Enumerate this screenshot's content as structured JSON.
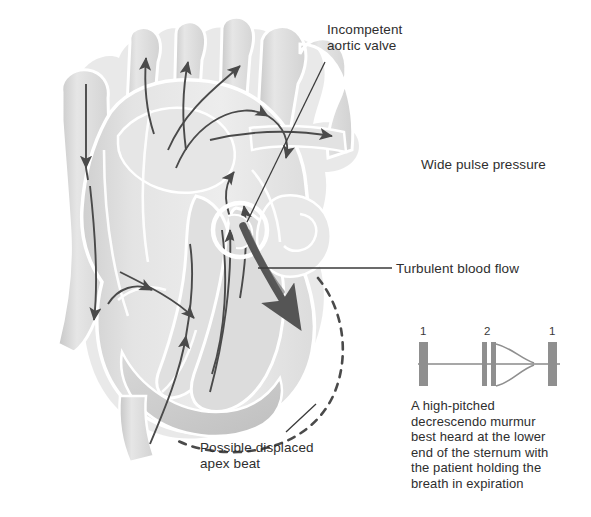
{
  "figure": {
    "background_color": "#ffffff",
    "ink_color": "#3a3a3a",
    "heart_fill_light": "#ececec",
    "heart_fill_mid": "#d9d9d9",
    "heart_fill_dark": "#c2c2c2",
    "highlight_color": "#ffffff"
  },
  "labels": {
    "aortic_valve": "Incompetent\naortic valve",
    "pulse_pressure": "Wide pulse pressure",
    "turbulent_flow": "Turbulent blood flow",
    "apex_beat": "Possible displaced\napex beat",
    "murmur": "A high-pitched\ndecrescendo murmur\nbest heard at the lower\nend of the sternum with\nthe patient holding the\nbreath in expiration"
  },
  "phonocardiogram": {
    "type": "heart-sound-trace",
    "sounds": [
      {
        "label": "1",
        "name": "first-heart-sound",
        "split": false
      },
      {
        "label": "2",
        "name": "second-heart-sound",
        "split": true
      },
      {
        "label": "1",
        "name": "first-heart-sound",
        "split": false
      }
    ],
    "murmur_shape": "decrescendo",
    "murmur_position": "after second heart sound"
  },
  "annotations": {
    "valve_marker": "white circle highlight over aortic valve",
    "regurgitant_jet": "thick arrow from aortic valve into left ventricle",
    "displaced_outline": "dashed curve outlining enlarged left ventricle"
  }
}
